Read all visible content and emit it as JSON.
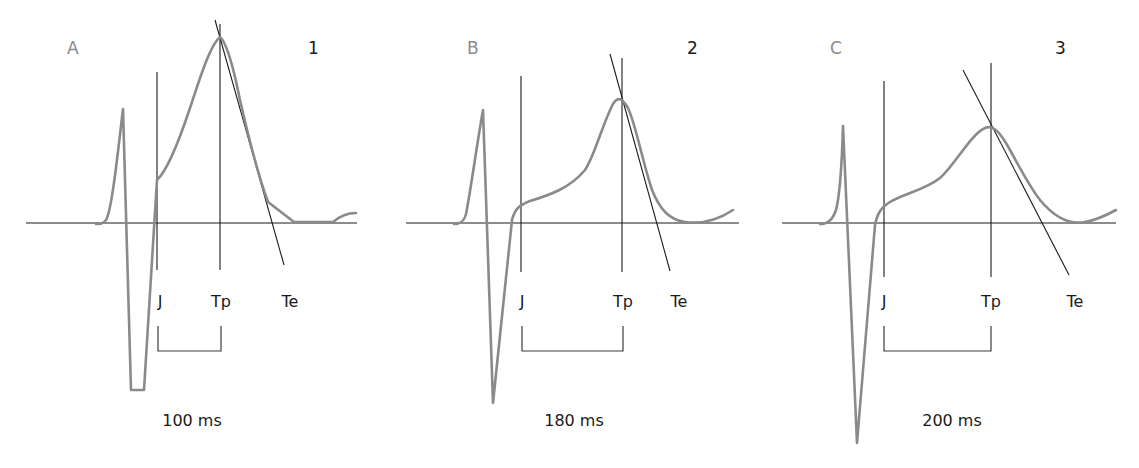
{
  "figure": {
    "panels": [
      {
        "letter": "A",
        "number": "1",
        "labels": {
          "j": "J",
          "tp": "Tp",
          "te": "Te"
        },
        "interval": "100 ms"
      },
      {
        "letter": "B",
        "number": "2",
        "labels": {
          "j": "J",
          "tp": "Tp",
          "te": "Te"
        },
        "interval": "180 ms"
      },
      {
        "letter": "C",
        "number": "3",
        "labels": {
          "j": "J",
          "tp": "Tp",
          "te": "Te"
        },
        "interval": "200 ms"
      }
    ]
  },
  "colors": {
    "trace": "#8a8a8a",
    "lines": "#1a1a1a",
    "background": "#ffffff"
  }
}
